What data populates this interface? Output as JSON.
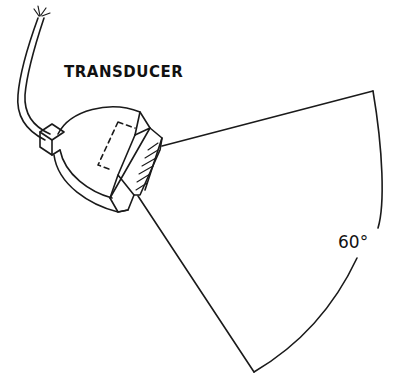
{
  "diagram": {
    "labels": {
      "component": "TRANSDUCER",
      "beam_angle": "60°"
    },
    "colors": {
      "ink": "#1a1a1a",
      "background": "#ffffff"
    },
    "parts": [
      "cable",
      "housing",
      "face-element",
      "beam-cone",
      "angle-arc"
    ]
  }
}
